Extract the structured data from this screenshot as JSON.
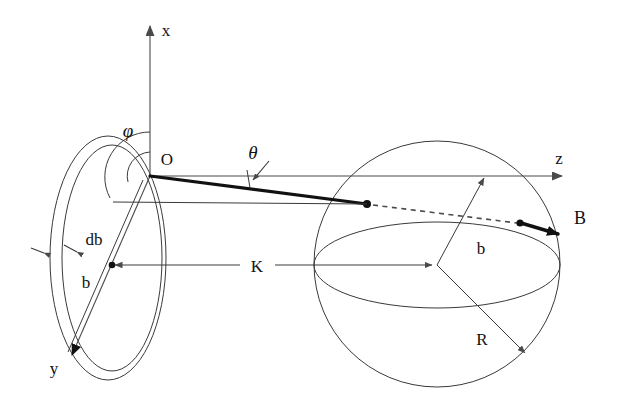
{
  "figure": {
    "background_color": "#ffffff",
    "line_color": "#3a3a3a",
    "accent_color": "#111111",
    "width": 617,
    "height": 415
  },
  "axes": {
    "x_label": "x",
    "y_label": "y",
    "z_label": "z",
    "origin_label": "O"
  },
  "angles": {
    "phi_label": "φ",
    "theta_label": "θ"
  },
  "ring": {
    "radius_label": "b",
    "thickness_label": "db"
  },
  "sphere": {
    "radius_label": "R",
    "impact_label": "b"
  },
  "vectors": {
    "field_label": "B",
    "separation_label": "K"
  }
}
